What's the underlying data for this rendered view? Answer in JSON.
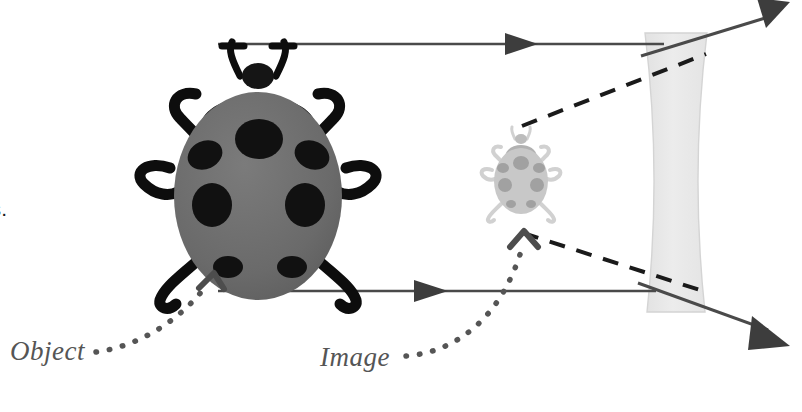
{
  "figure": {
    "background_color": "#ffffff"
  },
  "caption": {
    "visible_text": "nd\nght\ns a\na\nly is.",
    "note": "left-clipped body text at image edge"
  },
  "labels": {
    "object": "Object",
    "image": "Image",
    "color": "#555555"
  },
  "colors": {
    "ray_line": "#4a4a4a",
    "dashed_ray": "#1a1a1a",
    "lens_fill": "#e8e8e8",
    "lens_stroke": "#d2d2d2",
    "object_body": "#6e6e6e",
    "object_spots": "#111111",
    "object_head": "#111111",
    "image_body": "#c2c2c2",
    "image_spots": "#9a9a9a",
    "leader_dots": "#555555"
  },
  "optics": {
    "lens_type": "biconcave-diverging",
    "lens_center_x": 676,
    "lens_top_y": 33,
    "lens_bottom_y": 312,
    "object": {
      "name": "ladybug-object",
      "center_x": 258,
      "center_y": 190,
      "width": 230,
      "height": 250
    },
    "image": {
      "name": "ladybug-virtual-image",
      "center_x": 521,
      "center_y": 174,
      "width": 72,
      "height": 80
    },
    "rays": [
      {
        "name": "upper-incident-ray",
        "type": "solid",
        "x1": 218,
        "y1": 44,
        "x2": 660,
        "y2": 44,
        "arrow_at_x": 522
      },
      {
        "name": "lower-incident-ray",
        "type": "solid",
        "x1": 218,
        "y1": 291,
        "x2": 652,
        "y2": 291,
        "arrow_at_x": 432
      },
      {
        "name": "upper-refracted-ray",
        "type": "solid",
        "x1": 660,
        "y1": 44,
        "x2": 782,
        "y2": 8
      },
      {
        "name": "lower-refracted-ray",
        "type": "solid",
        "x1": 652,
        "y1": 291,
        "x2": 782,
        "y2": 342
      },
      {
        "name": "upper-virtual-extension",
        "type": "dashed",
        "x1": 527,
        "y1": 122,
        "x2": 700,
        "y2": 56
      },
      {
        "name": "lower-virtual-extension",
        "type": "dashed",
        "x1": 528,
        "y1": 232,
        "x2": 700,
        "y2": 290
      }
    ]
  }
}
